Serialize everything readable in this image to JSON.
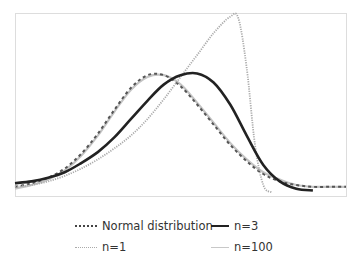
{
  "chart_data": {
    "type": "line",
    "title": "",
    "xlabel": "",
    "ylabel": "",
    "grid": false,
    "legend_position": "bottom",
    "xlim": [
      0,
      10
    ],
    "ylim": [
      0,
      1
    ],
    "series": [
      {
        "name": "Normal distribution",
        "style": "dotted",
        "color": "#555555",
        "x": [
          0,
          0.5,
          1,
          1.5,
          2,
          2.5,
          3,
          3.5,
          4,
          4.5,
          5,
          5.5,
          6,
          6.5,
          7,
          7.5,
          8,
          8.5,
          9,
          9.5,
          10
        ],
        "y": [
          0.05,
          0.07,
          0.1,
          0.15,
          0.23,
          0.34,
          0.47,
          0.59,
          0.66,
          0.66,
          0.6,
          0.5,
          0.39,
          0.28,
          0.19,
          0.12,
          0.08,
          0.06,
          0.05,
          0.05,
          0.05
        ]
      },
      {
        "name": "n=3",
        "style": "solid",
        "color": "#222222",
        "x": [
          0,
          0.5,
          1,
          1.5,
          2,
          2.5,
          3,
          3.5,
          4,
          4.5,
          5,
          5.5,
          6,
          6.5,
          7,
          7.5,
          8,
          8.5,
          9
        ],
        "y": [
          0.07,
          0.08,
          0.1,
          0.13,
          0.18,
          0.24,
          0.32,
          0.42,
          0.52,
          0.61,
          0.66,
          0.67,
          0.62,
          0.5,
          0.33,
          0.17,
          0.08,
          0.04,
          0.03
        ]
      },
      {
        "name": "n=1",
        "style": "dotted",
        "color": "#aaaaaa",
        "x": [
          0,
          0.5,
          1,
          1.5,
          2,
          2.5,
          3,
          3.5,
          4,
          4.5,
          5,
          5.5,
          6,
          6.5,
          6.75,
          7,
          7.25,
          7.5,
          7.75
        ],
        "y": [
          0.05,
          0.06,
          0.08,
          0.11,
          0.15,
          0.2,
          0.26,
          0.33,
          0.42,
          0.53,
          0.65,
          0.77,
          0.89,
          0.98,
          0.97,
          0.7,
          0.28,
          0.06,
          0.02
        ]
      },
      {
        "name": "n=100",
        "style": "solid",
        "color": "#c4c4c4",
        "x": [
          0,
          0.5,
          1,
          1.5,
          2,
          2.5,
          3,
          3.5,
          4,
          4.5,
          5,
          5.5,
          6,
          6.5,
          7,
          7.5,
          8,
          8.5,
          9,
          9.5,
          10
        ],
        "y": [
          0.04,
          0.06,
          0.09,
          0.14,
          0.22,
          0.33,
          0.46,
          0.58,
          0.65,
          0.66,
          0.61,
          0.51,
          0.4,
          0.29,
          0.2,
          0.13,
          0.09,
          0.06,
          0.05,
          0.05,
          0.05
        ]
      }
    ]
  },
  "legend": {
    "items": [
      {
        "label": "Normal distribution"
      },
      {
        "label": "n=3"
      },
      {
        "label": "n=1"
      },
      {
        "label": "n=100"
      }
    ]
  }
}
